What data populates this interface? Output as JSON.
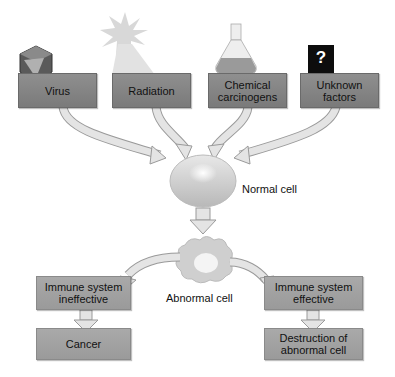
{
  "causes": [
    {
      "label": "Virus",
      "icon": "virus-icon"
    },
    {
      "label": "Radiation",
      "icon": "radiation-sun-icon"
    },
    {
      "label": "Chemical carcinogens",
      "icon": "flask-icon"
    },
    {
      "label": "Unknown factors",
      "icon": "question-mark-icon",
      "icon_glyph": "?"
    }
  ],
  "normal_cell": {
    "label": "Normal cell"
  },
  "abnormal_cell": {
    "label": "Abnormal cell"
  },
  "branches": {
    "left": {
      "condition": "Immune system ineffective",
      "outcome": "Cancer"
    },
    "right": {
      "condition": "Immune system effective",
      "outcome": "Destruction of abnormal cell"
    }
  },
  "colors": {
    "box_dark": "#838383",
    "box_light": "#a3a3a3",
    "arrow_fill": "#e4e4e4",
    "arrow_stroke": "#9a9a9a"
  }
}
